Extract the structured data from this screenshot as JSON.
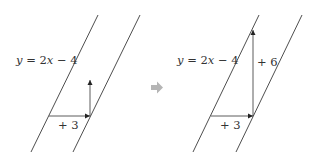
{
  "panels": [
    {
      "equation": {
        "y": "y",
        "eq": " = 2",
        "x": "x",
        "rest": " − 4"
      },
      "horizontal_label": "+ 3"
    },
    {
      "equation": {
        "y": "y",
        "eq": " = 2",
        "x": "x",
        "rest": " − 4"
      },
      "horizontal_label": "+ 3",
      "vertical_label": "+ 6"
    }
  ],
  "colors": {
    "line": "#3a3a3a",
    "arrow_gray": "#b5b5b5"
  }
}
